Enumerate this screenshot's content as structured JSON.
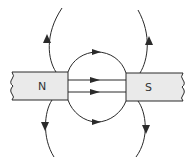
{
  "diagram": {
    "type": "magnetic-field-lines",
    "magnets": [
      {
        "pole": "N",
        "label": "N"
      },
      {
        "pole": "S",
        "label": "S"
      }
    ],
    "colors": {
      "magnet_fill": "#eaeaea",
      "line": "#2a2a2a",
      "background": "#ffffff"
    }
  }
}
